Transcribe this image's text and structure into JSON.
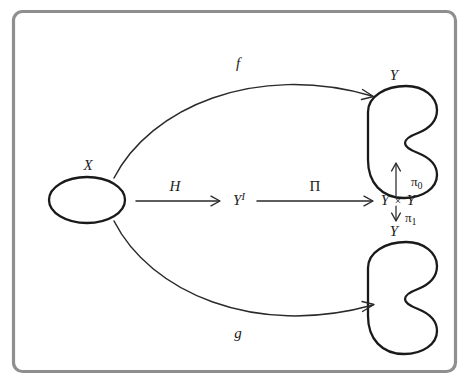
{
  "figure": {
    "background_color": "#ffffff",
    "frame_color": "#8f8f8f",
    "ink_color": "#1a1a1a"
  },
  "objects": [
    {
      "id": "X",
      "label": "X",
      "shape": "ellipse",
      "label_position": "above",
      "name": "object-x"
    },
    {
      "id": "Y_top",
      "label": "Y",
      "shape": "blob",
      "label_position": "above",
      "name": "object-y-top"
    },
    {
      "id": "Y_bottom",
      "label": "Y",
      "shape": "blob",
      "label_position": "above",
      "name": "object-y-bottom"
    },
    {
      "id": "path_space",
      "label": "Y",
      "superscript": "I",
      "shape": "text",
      "name": "object-path-space"
    },
    {
      "id": "product",
      "label_left": "Y",
      "operator": "×",
      "label_right": "Y",
      "shape": "text",
      "name": "object-product"
    }
  ],
  "arrows": [
    {
      "id": "f",
      "label": "f",
      "from": "X",
      "to": "Y_top",
      "style": "curved",
      "name": "arrow-f"
    },
    {
      "id": "g",
      "label": "g",
      "from": "X",
      "to": "Y_bottom",
      "style": "curved",
      "name": "arrow-g"
    },
    {
      "id": "H",
      "label": "H",
      "from": "X",
      "to": "path_space",
      "style": "straight",
      "name": "arrow-h"
    },
    {
      "id": "Pi",
      "label": "Π",
      "from": "path_space",
      "to": "product",
      "style": "straight",
      "name": "arrow-pi"
    },
    {
      "id": "pi0",
      "label": "π",
      "subscript": "0",
      "from": "product",
      "to": "Y_top",
      "style": "vertical-up",
      "name": "arrow-pi-zero"
    },
    {
      "id": "pi1",
      "label": "π",
      "subscript": "1",
      "from": "product",
      "to": "Y_bottom",
      "style": "vertical-down",
      "name": "arrow-pi-one"
    }
  ],
  "labels": {
    "x": "X",
    "y_top": "Y",
    "y_bottom": "Y",
    "y_path_base": "Y",
    "y_path_sup": "I",
    "product_left": "Y",
    "product_times": "×",
    "product_right": "Y",
    "f": "f",
    "g": "g",
    "h": "H",
    "pi_capital": "Π",
    "pi_zero_base": "π",
    "pi_zero_sub": "0",
    "pi_one_base": "π",
    "pi_one_sub": "1"
  }
}
